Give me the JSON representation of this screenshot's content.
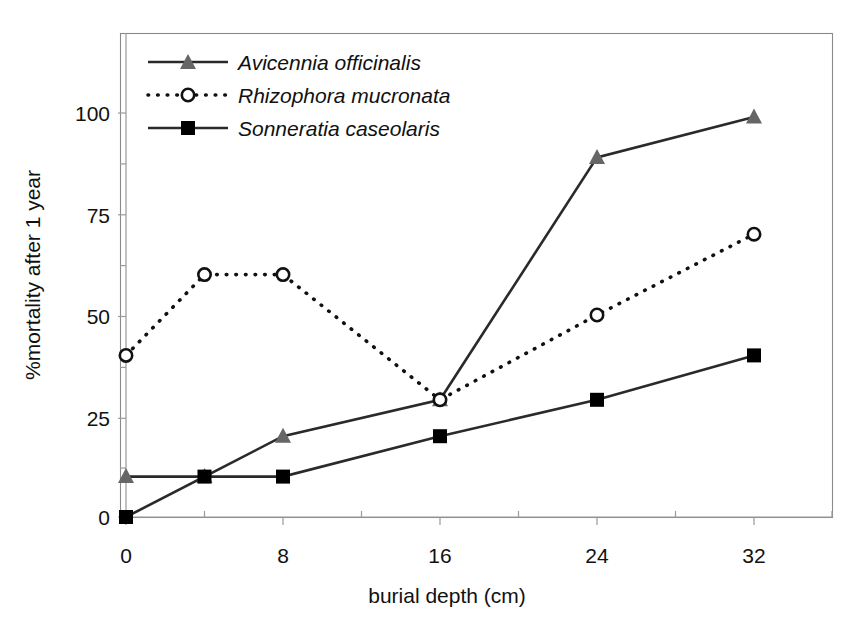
{
  "chart_data": {
    "type": "line",
    "title": "",
    "xlabel": "burial depth (cm)",
    "ylabel": "%mortality after 1 year",
    "x": [
      0,
      4,
      8,
      16,
      24,
      32
    ],
    "xlim": [
      0,
      34
    ],
    "ylim": [
      0,
      108
    ],
    "xticks": [
      0,
      8,
      16,
      24,
      32
    ],
    "xtick_labels": [
      "0",
      "8",
      "16",
      "24",
      "32"
    ],
    "xminor_ticks": [
      4,
      12,
      20,
      28
    ],
    "yticks": [
      0,
      25,
      50,
      75,
      100
    ],
    "ytick_labels": [
      "0",
      "25",
      "50",
      "75",
      "100"
    ],
    "yminor_ticks": [
      12.5,
      37.5,
      62.5,
      87.5
    ],
    "grid": false,
    "legend_position": "top-left",
    "series": [
      {
        "name": "Avicennia officinalis",
        "marker": "triangle",
        "marker_color": "#666666",
        "line_style": "solid",
        "line_color": "#222222",
        "values": [
          10,
          10,
          20,
          29,
          89,
          99
        ]
      },
      {
        "name": "Rhizophora mucronata",
        "marker": "circle-open",
        "marker_color": "#ffffff",
        "line_style": "dotted",
        "line_color": "#111111",
        "values": [
          40,
          60,
          60,
          29,
          50,
          70
        ]
      },
      {
        "name": "Sonneratia caseolaris",
        "marker": "square",
        "marker_color": "#000000",
        "line_style": "solid",
        "line_color": "#222222",
        "values": [
          0,
          10,
          10,
          20,
          29,
          40
        ]
      }
    ]
  },
  "axes": {
    "y_title": "%mortality after 1 year",
    "x_title": "burial depth (cm)",
    "y_tick_0": "0",
    "y_tick_25": "25",
    "y_tick_50": "50",
    "y_tick_75": "75",
    "y_tick_100": "100",
    "x_tick_0": "0",
    "x_tick_8": "8",
    "x_tick_16": "16",
    "x_tick_24": "24",
    "x_tick_32": "32"
  },
  "legend": {
    "entries": [
      {
        "label": "Avicennia officinalis"
      },
      {
        "label": "Rhizophora mucronata"
      },
      {
        "label": "Sonneratia caseolaris"
      }
    ]
  }
}
